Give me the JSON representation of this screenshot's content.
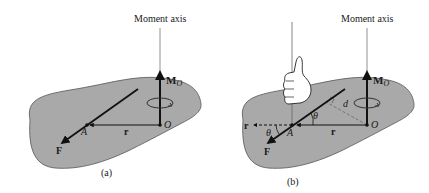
{
  "figure": {
    "panel_a": {
      "caption": "(a)",
      "axis_label": "Moment axis",
      "moment_label": "M",
      "moment_subscript": "O",
      "point_O": "O",
      "point_A": "A",
      "position_vector": "r",
      "force": "F"
    },
    "panel_b": {
      "caption": "(b)",
      "axis_label": "Moment axis",
      "moment_label": "M",
      "moment_subscript": "O",
      "point_O": "O",
      "point_A": "A",
      "position_vector": "r",
      "position_vector_shifted": "r",
      "force": "F",
      "angle_1": "θ",
      "angle_2": "θ",
      "moment_arm": "d"
    }
  },
  "colors": {
    "body_fill": "#a9a9a9",
    "body_stroke": "#4a4a4a",
    "vector": "#111111",
    "axis_line": "#777777",
    "dashed": "#6a6a6a"
  }
}
